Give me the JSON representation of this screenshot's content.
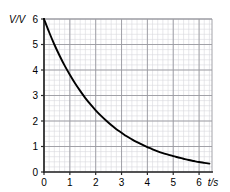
{
  "chart_data": {
    "type": "line",
    "title": "",
    "subtitle": "",
    "xlabel": "t/s",
    "ylabel": "V/V",
    "xlim": [
      0,
      6.5
    ],
    "ylim": [
      0,
      6
    ],
    "xticks": [
      0,
      1,
      2,
      3,
      4,
      5,
      6
    ],
    "yticks": [
      0,
      1,
      2,
      3,
      4,
      5,
      6
    ],
    "xtick_labels": [
      "0",
      "1",
      "2",
      "3",
      "4",
      "5",
      "6"
    ],
    "ytick_labels": [
      "0",
      "1",
      "2",
      "3",
      "4",
      "5",
      "6"
    ],
    "grid": true,
    "minor_grid": true,
    "minor_divisions_per_major": 5,
    "legend": null,
    "legend_position": "none",
    "series": [
      {
        "name": "V",
        "kind": "exponential-decay",
        "color": "#000000",
        "x": [
          0,
          0.2,
          0.4,
          0.6,
          0.8,
          1.0,
          1.2,
          1.4,
          1.6,
          1.8,
          2.0,
          2.2,
          2.4,
          2.6,
          2.8,
          3.0,
          3.2,
          3.4,
          3.6,
          3.8,
          4.0,
          4.2,
          4.4,
          4.6,
          4.8,
          5.0,
          5.2,
          5.4,
          5.6,
          5.8,
          6.0,
          6.2,
          6.4
        ],
        "values": [
          6.0,
          5.48,
          5.0,
          4.57,
          4.17,
          3.81,
          3.48,
          3.18,
          2.9,
          2.65,
          2.42,
          2.21,
          2.02,
          1.84,
          1.68,
          1.54,
          1.4,
          1.28,
          1.17,
          1.07,
          0.98,
          0.89,
          0.81,
          0.74,
          0.68,
          0.62,
          0.57,
          0.52,
          0.47,
          0.43,
          0.39,
          0.36,
          0.33
        ]
      }
    ],
    "annotations": []
  },
  "axes": {
    "y_axis_label": "V/V",
    "x_axis_label": "t/s"
  },
  "ticks": {
    "y": [
      "6",
      "5",
      "4",
      "3",
      "2",
      "1",
      "0"
    ],
    "x": [
      "0",
      "1",
      "2",
      "3",
      "4",
      "5",
      "6"
    ]
  },
  "colors": {
    "curve": "#1a1a1a",
    "major_grid": "#9a9aa0",
    "minor_grid": "#d8d8dd",
    "axis": "#2a2a2a",
    "text": "#000000",
    "background": "#ffffff"
  }
}
